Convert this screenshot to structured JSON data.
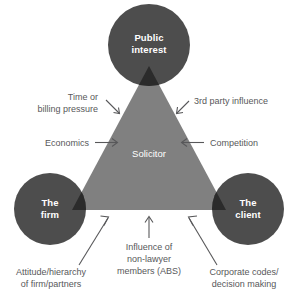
{
  "diagram": {
    "type": "triangle-influence-diagram",
    "colors": {
      "circle_fill": "#4d4d4d",
      "triangle_fill": "#808080",
      "wedge_fill": "#2b2b2b",
      "text_on_dark": "#ffffff",
      "annotation_text": "#58585a",
      "background": "#ffffff"
    },
    "center": {
      "label": "Solicitor"
    },
    "nodes": [
      {
        "id": "public-interest",
        "line1": "Public",
        "line2": "interest",
        "position": "top"
      },
      {
        "id": "the-firm",
        "line1": "The",
        "line2": "firm",
        "position": "bottom-left"
      },
      {
        "id": "the-client",
        "line1": "The",
        "line2": "client",
        "position": "bottom-right"
      }
    ],
    "annotations": [
      {
        "id": "time-or-billing-pressure",
        "lines": [
          "Time or",
          "billing pressure"
        ],
        "arrow": "down-right",
        "side": "upper-left"
      },
      {
        "id": "third-party-influence",
        "lines": [
          "3rd party influence"
        ],
        "arrow": "down-left",
        "side": "upper-right"
      },
      {
        "id": "economics",
        "lines": [
          "Economics"
        ],
        "arrow": "right",
        "side": "middle-left"
      },
      {
        "id": "competition",
        "lines": [
          "Competition"
        ],
        "arrow": "left",
        "side": "middle-right"
      },
      {
        "id": "attitude-hierarchy-of-firm-partners",
        "lines": [
          "Attitude/hierarchy",
          "of firm/partners"
        ],
        "arrow": "up-right",
        "side": "bottom-left"
      },
      {
        "id": "influence-of-non-lawyer-members-abs",
        "lines": [
          "Influence of",
          "non-lawyer",
          "members (ABS)"
        ],
        "arrow": "up",
        "side": "bottom-center"
      },
      {
        "id": "corporate-codes-decision-making",
        "lines": [
          "Corporate codes/",
          "decision making"
        ],
        "arrow": "up-left",
        "side": "bottom-right"
      }
    ]
  }
}
